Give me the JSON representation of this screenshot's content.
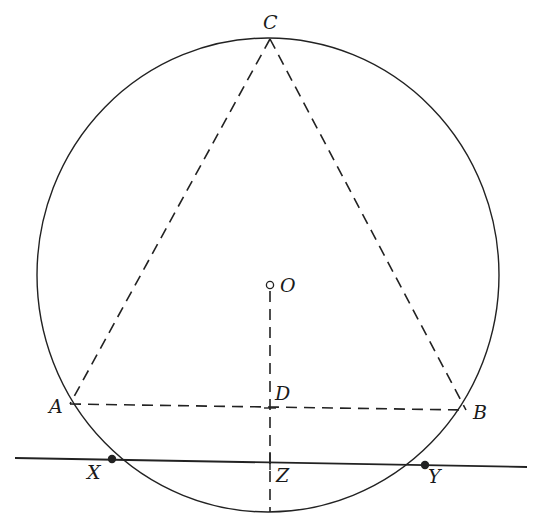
{
  "diagram": {
    "circle": {
      "center_label": "O",
      "cx": 268,
      "cy": 275,
      "rx": 231,
      "ry": 237
    },
    "points": {
      "C": {
        "label": "C",
        "x": 270,
        "y": 39
      },
      "O": {
        "label": "O",
        "x": 270,
        "y": 285
      },
      "A": {
        "label": "A",
        "x": 70,
        "y": 404
      },
      "B": {
        "label": "B",
        "x": 466,
        "y": 410
      },
      "D": {
        "label": "D",
        "x": 270,
        "y": 408
      },
      "X": {
        "label": "X",
        "x": 112,
        "y": 459
      },
      "Y": {
        "label": "Y",
        "x": 425,
        "y": 465
      },
      "Z": {
        "label": "Z",
        "x": 270,
        "y": 461
      }
    },
    "segments": [
      {
        "from": "C",
        "to": "A",
        "style": "dashed"
      },
      {
        "from": "C",
        "to": "B",
        "style": "dashed"
      },
      {
        "from": "A",
        "to": "B",
        "style": "dashed"
      },
      {
        "from": "O",
        "to": "circle-bottom",
        "style": "dashed"
      },
      {
        "from": "line-left",
        "to": "line-right",
        "style": "solid",
        "through": [
          "X",
          "Z",
          "Y"
        ]
      }
    ],
    "colors": {
      "ink": "#222222",
      "background": "#ffffff"
    }
  }
}
